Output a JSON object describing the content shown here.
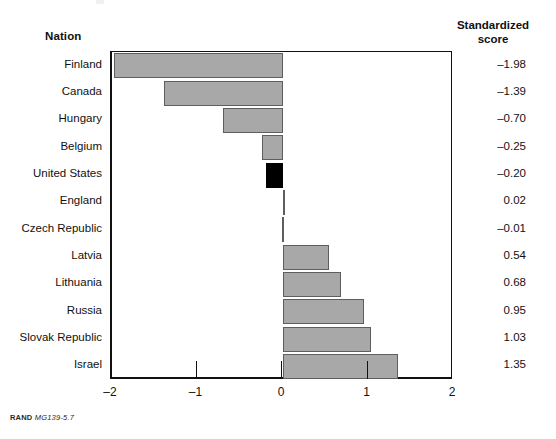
{
  "headers": {
    "nation": "Nation",
    "score_line1": "Standardized",
    "score_line2": "score"
  },
  "footer": {
    "source": "RAND",
    "code": "MG139-5.7"
  },
  "chart_data": {
    "type": "bar",
    "orientation": "horizontal",
    "title": "",
    "xlabel": "",
    "ylabel": "Nation",
    "value_column_label": "Standardized score",
    "xlim": [
      -2,
      2
    ],
    "xticks": [
      -2,
      -1,
      0,
      1,
      2
    ],
    "xticklabels": [
      "–2",
      "–1",
      "0",
      "1",
      "2"
    ],
    "grid": false,
    "legend": null,
    "zero_line": 0,
    "bar_fill": "#a8a8a8",
    "bar_stroke": "#5e5e5e",
    "highlight_fill": "#000000",
    "highlight_category": "United States",
    "categories": [
      "Finland",
      "Canada",
      "Hungary",
      "Belgium",
      "United States",
      "England",
      "Czech Republic",
      "Latvia",
      "Lithuania",
      "Russia",
      "Slovak Republic",
      "Israel"
    ],
    "values": [
      -1.98,
      -1.39,
      -0.7,
      -0.25,
      -0.2,
      0.02,
      -0.01,
      0.54,
      0.68,
      0.95,
      1.03,
      1.35
    ],
    "value_labels": [
      "–1.98",
      "–1.39",
      "–0.70",
      "–0.25",
      "–0.20",
      "0.02",
      "–0.01",
      "0.54",
      "0.68",
      "0.95",
      "1.03",
      "1.35"
    ],
    "highlighted": [
      false,
      false,
      false,
      false,
      true,
      false,
      false,
      false,
      false,
      false,
      false,
      false
    ]
  }
}
